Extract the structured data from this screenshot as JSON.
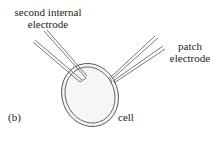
{
  "figure": {
    "panel_label": "(b)",
    "labels": {
      "second_internal_electrode_line1": "second internal",
      "second_internal_electrode_line2": "electrode",
      "patch_electrode_line1": "patch",
      "patch_electrode_line2": "electrode",
      "cell": "cell"
    },
    "colors": {
      "stroke": "#555555",
      "cell_fill": "#f4f4f4",
      "text": "#222222",
      "background": "#ffffff"
    },
    "components": [
      "second internal electrode",
      "patch electrode",
      "cell"
    ]
  }
}
